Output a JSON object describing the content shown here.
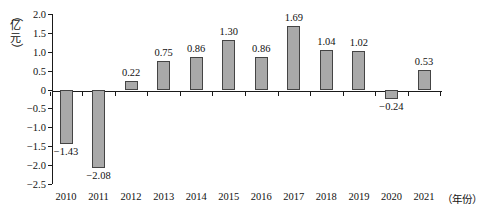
{
  "chart_data": {
    "type": "bar",
    "title": "",
    "subtitle": "",
    "xlabel": "（年份）",
    "ylabel": "（亿元）",
    "ylabel_chars": [
      "（",
      "亿",
      "元",
      "）"
    ],
    "categories": [
      "2010",
      "2011",
      "2012",
      "2013",
      "2014",
      "2015",
      "2016",
      "2017",
      "2018",
      "2019",
      "2020",
      "2021"
    ],
    "values": [
      -1.43,
      -2.08,
      0.22,
      0.75,
      0.86,
      1.3,
      0.86,
      1.69,
      1.04,
      1.02,
      -0.24,
      0.53
    ],
    "value_labels": [
      "−1.43",
      "−2.08",
      "0.22",
      "0.75",
      "0.86",
      "1.30",
      "0.86",
      "1.69",
      "1.04",
      "1.02",
      "−0.24",
      "0.53"
    ],
    "ylim": [
      -2.5,
      2.0
    ],
    "ytick_values": [
      2.0,
      1.5,
      1.0,
      0.5,
      0,
      -0.5,
      -1.0,
      -1.5,
      -2.0,
      -2.5
    ],
    "ytick_labels": [
      "2.0",
      "1.5",
      "1.0",
      "0.5",
      "0",
      "−0.5",
      "−1.0",
      "−1.5",
      "−2.0",
      "−2.5"
    ],
    "grid": false,
    "legend": null,
    "bar_color": "#a9a9a9",
    "bar_border_color": "#444444",
    "axis_color": "#1a1a1a"
  }
}
